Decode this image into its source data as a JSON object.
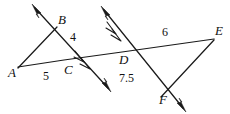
{
  "figure": {
    "background_color": "#ffffff",
    "stroke_color": "#1a1a1a",
    "width": 230,
    "height": 114
  },
  "points": [
    {
      "id": "A",
      "label": "A",
      "x": 8,
      "y": 73
    },
    {
      "id": "B",
      "label": "B",
      "x": 58,
      "y": 20
    },
    {
      "id": "C",
      "label": "C",
      "x": 64,
      "y": 76
    },
    {
      "id": "D",
      "label": "D",
      "x": 119,
      "y": 63
    },
    {
      "id": "E",
      "label": "E",
      "x": 215,
      "y": 34
    },
    {
      "id": "F",
      "label": "F",
      "x": 159,
      "y": 103
    }
  ],
  "measures": [
    {
      "id": "AC",
      "label": "5",
      "x": 43,
      "y": 78,
      "segment": "A to C"
    },
    {
      "id": "BC",
      "label": "4",
      "x": 70,
      "y": 38,
      "segment": "B to C side"
    },
    {
      "id": "DE",
      "label": "6",
      "x": 162,
      "y": 34,
      "segment": "D to E"
    },
    {
      "id": "DF",
      "label": "7.5",
      "x": 124,
      "y": 80,
      "segment": "D to F"
    }
  ],
  "marks": {
    "parallel_tick_count": 2,
    "description": "double chevron hash marks on both rays indicating parallel lines"
  },
  "rays": [
    {
      "id": "ray-through-B",
      "from": "C-region",
      "direction": "upper-left",
      "arrows": "both ends",
      "ticks": 2
    },
    {
      "id": "ray-through-D",
      "from": "D",
      "direction": "upper-left",
      "arrows": "both ends",
      "ticks": 2
    }
  ],
  "segments": [
    {
      "id": "A-E",
      "description": "transversal line from A through C and D to E"
    },
    {
      "id": "A-B",
      "description": "segment from A up to B"
    },
    {
      "id": "E-F",
      "description": "segment from E down to F"
    }
  ]
}
